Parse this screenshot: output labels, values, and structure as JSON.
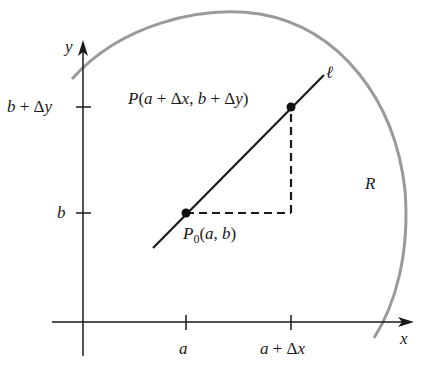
{
  "figure": {
    "axes": {
      "x_label": "x",
      "y_label": "y"
    },
    "ticks": {
      "x": [
        {
          "label": "a",
          "x": 186
        },
        {
          "label": "a + Δx",
          "x": 291
        }
      ],
      "y": [
        {
          "label": "b + Δy",
          "y": 107
        },
        {
          "label": "b",
          "y": 213
        }
      ]
    },
    "points": {
      "p0": {
        "label_main": "P",
        "label_sub": "0",
        "label_rest": "(a, b)"
      },
      "p": {
        "label": "P(a + Δx, b + Δy)"
      }
    },
    "line_label": "ℓ",
    "region_label": "R",
    "colors": {
      "ink": "#1a1a1a",
      "region_arc": "#9a9a9a"
    }
  }
}
